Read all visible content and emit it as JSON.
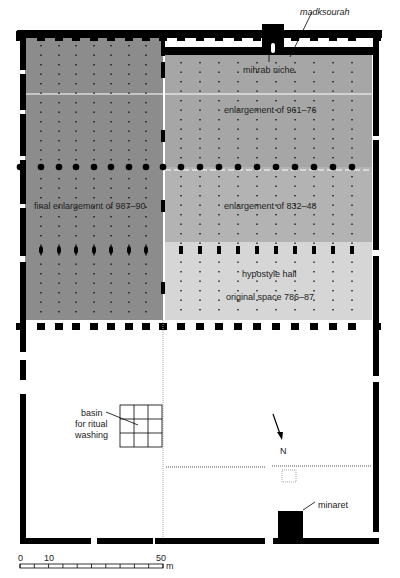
{
  "colors": {
    "final_enlargement": "#8c8c8c",
    "enlargement_961": "#a6a6a6",
    "enlargement_832": "#b3b3b3",
    "original_space": "#d6d6d6",
    "wall": "#000000",
    "courtyard": "#ffffff"
  },
  "labels": {
    "madksourah": "madksourah",
    "mihrab": "mihrab niche",
    "enlargement_961": "enlargement of 961–76",
    "final_enlargement": "final enlargement of 987–90",
    "enlargement_832": "enlargement of 832–48",
    "hypostyle": "hypostyle hall",
    "original_space": "original space 786–87",
    "basin_1": "basin",
    "basin_2": "for ritual",
    "basin_3": "washing",
    "north": "N",
    "minaret": "minaret"
  },
  "scale_bar": {
    "ticks": [
      "0",
      "10",
      "50"
    ],
    "unit": "m"
  }
}
